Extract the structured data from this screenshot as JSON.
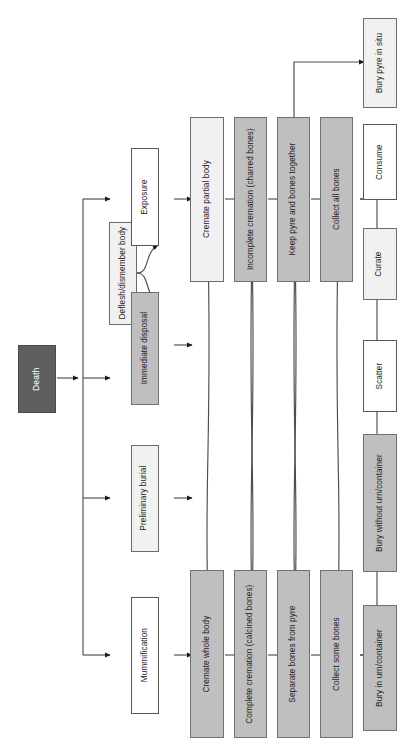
{
  "figure": {
    "type": "flowchart",
    "orientation": "rotated-90-ccw",
    "canvas": {
      "width": 414,
      "height": 746
    }
  },
  "palette": {
    "white": "#ffffff",
    "pale_gray": "#f1f1f1",
    "mid_gray": "#bfbfbf",
    "dark_gray": "#5e5e5e",
    "stroke": "#565656",
    "text_dark": "#1c1c1c",
    "text_light": "#ffffff"
  },
  "nodes": {
    "death": {
      "label": "Death",
      "fill": "dark"
    },
    "deflesh": {
      "label": "Deflesh/dismember body",
      "fill": "pale"
    },
    "exposure": {
      "label": "Exposure",
      "fill": "white"
    },
    "immediate": {
      "label": "Immediate disposal",
      "fill": "gray"
    },
    "preliminary": {
      "label": "Preliminary burial",
      "fill": "pale"
    },
    "mummification": {
      "label": "Mummification",
      "fill": "white"
    },
    "cremate_partial": {
      "label": "Cremate partial body",
      "fill": "pale"
    },
    "incomplete_crem": {
      "label": "Incomplete cremation (charred bones)",
      "fill": "gray"
    },
    "keep_pyre": {
      "label": "Keep pyre and bones together",
      "fill": "gray"
    },
    "collect_all": {
      "label": "Collect all bones",
      "fill": "gray"
    },
    "cremate_whole": {
      "label": "Cremate whole body",
      "fill": "gray"
    },
    "complete_crem": {
      "label": "Complete cremation (calcined bones)",
      "fill": "gray"
    },
    "separate_bones": {
      "label": "Separate bones from pyre",
      "fill": "gray"
    },
    "collect_some": {
      "label": "Collect some bones",
      "fill": "gray"
    },
    "bury_pyre": {
      "label": "Bury pyre in situ",
      "fill": "pale"
    },
    "consume": {
      "label": "Consume",
      "fill": "white"
    },
    "curate": {
      "label": "Curate",
      "fill": "pale"
    },
    "scatter": {
      "label": "Scatter",
      "fill": "white"
    },
    "bury_without_urn": {
      "label": "Bury without urn/container",
      "fill": "gray"
    },
    "bury_in_urn": {
      "label": "Bury in urn/container",
      "fill": "gray"
    }
  },
  "edges": [
    {
      "from": "death",
      "to": "deflesh"
    },
    {
      "from": "death",
      "to": "immediate"
    },
    {
      "from": "death",
      "to": "preliminary"
    },
    {
      "from": "death",
      "to": "mummification"
    },
    {
      "from": "deflesh",
      "to": "exposure"
    },
    {
      "from": "deflesh",
      "to": "immediate"
    },
    {
      "from": "exposure",
      "to": "cremate_partial"
    },
    {
      "from": "immediate",
      "to": "cremate_whole"
    },
    {
      "from": "preliminary",
      "to": "cremate_whole"
    },
    {
      "from": "mummification",
      "to": "cremate_whole"
    },
    {
      "from": "cremate_partial",
      "to": "incomplete_crem"
    },
    {
      "from": "incomplete_crem",
      "to": "keep_pyre"
    },
    {
      "from": "keep_pyre",
      "to": "collect_all"
    },
    {
      "from": "keep_pyre",
      "to": "bury_pyre"
    },
    {
      "from": "cremate_whole",
      "to": "complete_crem"
    },
    {
      "from": "complete_crem",
      "to": "separate_bones"
    },
    {
      "from": "separate_bones",
      "to": "collect_some"
    },
    {
      "from": "cremate_whole",
      "to": "incomplete_crem"
    },
    {
      "from": "cremate_partial",
      "to": "complete_crem"
    },
    {
      "from": "complete_crem",
      "to": "keep_pyre"
    },
    {
      "from": "incomplete_crem",
      "to": "separate_bones"
    },
    {
      "from": "separate_bones",
      "to": "collect_all"
    },
    {
      "from": "keep_pyre",
      "to": "collect_some"
    },
    {
      "from": "collect_all",
      "to": "consume"
    },
    {
      "from": "collect_all",
      "to": "curate"
    },
    {
      "from": "collect_all",
      "to": "scatter"
    },
    {
      "from": "collect_all",
      "to": "bury_without_urn"
    },
    {
      "from": "collect_all",
      "to": "bury_in_urn"
    },
    {
      "from": "collect_some",
      "to": "consume"
    },
    {
      "from": "collect_some",
      "to": "curate"
    },
    {
      "from": "collect_some",
      "to": "scatter"
    },
    {
      "from": "collect_some",
      "to": "bury_without_urn"
    },
    {
      "from": "collect_some",
      "to": "bury_in_urn"
    }
  ]
}
